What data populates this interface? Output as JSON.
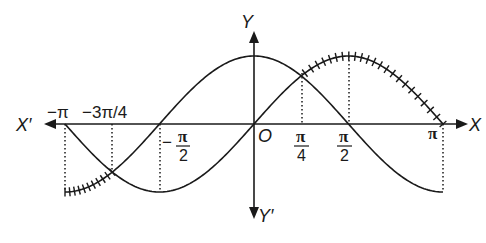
{
  "diagram": {
    "type": "graph-of-trigonometric-functions",
    "axes": {
      "x_positive_label": "X",
      "x_negative_label": "X′",
      "y_positive_label": "Y",
      "y_negative_label": "Y′",
      "origin_label": "O"
    },
    "curves": [
      {
        "name": "sin x",
        "description": "sine curve from -π to π"
      },
      {
        "name": "cos x",
        "description": "cosine curve from -π to π, peak at origin"
      }
    ],
    "tick_labels": {
      "neg_pi": "−π",
      "neg_3pi_4": "−3π/4",
      "neg_pi_2_sign": "−",
      "neg_pi_2_num": "π",
      "neg_pi_2_den": "2",
      "pi_4_num": "π",
      "pi_4_den": "4",
      "pi_2_num": "π",
      "pi_2_den": "2",
      "pi": "π"
    },
    "intersections": [
      {
        "x": "π/4",
        "y": "1/√2"
      },
      {
        "x": "−3π/4",
        "y": "−1/√2"
      }
    ],
    "hatched_regions": [
      {
        "from": "−π",
        "to": "−3π/4",
        "curve": "cos x (upper of the two)"
      },
      {
        "from": "π/4",
        "to": "π",
        "curve": "sin x (upper of the two)"
      }
    ],
    "colors": {
      "ink": "#1a1a1a",
      "background": "#ffffff"
    }
  }
}
